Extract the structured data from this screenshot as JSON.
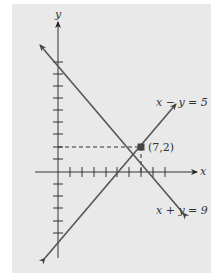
{
  "diagram": {
    "axes": {
      "x_label": "x",
      "y_label": "y",
      "x_ticks": [
        1,
        2,
        3,
        4,
        5,
        6,
        7,
        8,
        9
      ],
      "y_ticks": [
        -5,
        -4,
        -3,
        -2,
        -1,
        1,
        2,
        3,
        4,
        5,
        6,
        7,
        8,
        9
      ]
    },
    "lines": [
      {
        "equation": "x − y = 5",
        "label": "x − y = 5"
      },
      {
        "equation": "x + y = 9",
        "label": "x + y = 9"
      }
    ],
    "intersection": {
      "x": 7,
      "y": 2,
      "label": "(7,2)"
    },
    "colors": {
      "background": "#e9e9e9",
      "axis": "#333333",
      "line": "#555555",
      "point": "#444444"
    }
  }
}
